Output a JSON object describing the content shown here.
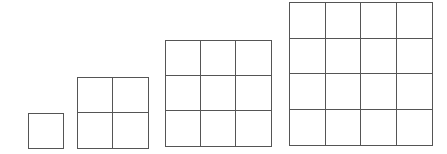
{
  "line_color": "#555555",
  "background": "#ffffff",
  "figures": [
    {
      "name": "grid-1x1",
      "n": 1,
      "x": 28,
      "y": 113,
      "size": 36
    },
    {
      "name": "grid-2x2",
      "n": 2,
      "x": 77,
      "y": 77,
      "size": 72
    },
    {
      "name": "grid-3x3",
      "n": 3,
      "x": 165,
      "y": 40,
      "size": 107
    },
    {
      "name": "grid-4x4",
      "n": 4,
      "x": 289,
      "y": 2,
      "size": 144
    }
  ]
}
